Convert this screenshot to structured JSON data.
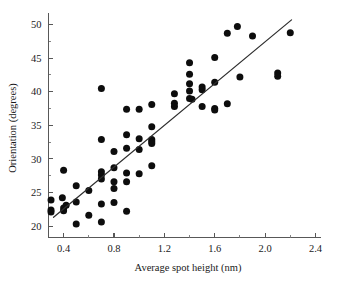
{
  "figure": {
    "background_color": "#ffffff",
    "point_color": "#0d0d0d",
    "line_color": "#2e2e2e",
    "axis_color": "#585858"
  },
  "chart_data": {
    "type": "scatter",
    "title": "",
    "xlabel": "Average spot height (nm)",
    "ylabel": "Orientation (degrees)",
    "xlim": [
      0.28,
      2.44
    ],
    "ylim": [
      18.3,
      51.8
    ],
    "xticks": [
      0.4,
      0.8,
      1.2,
      1.6,
      2.0,
      2.4
    ],
    "xtick_labels": [
      "0.4",
      "0.8",
      "1.2",
      "1.6",
      "2.0",
      "2.4"
    ],
    "xminor_ticks": [
      0.6,
      1.0,
      1.4,
      1.8,
      2.2
    ],
    "yticks": [
      20,
      25,
      30,
      35,
      40,
      45,
      50
    ],
    "ytick_labels": [
      "20",
      "25",
      "30",
      "35",
      "40",
      "45",
      "50"
    ],
    "grid": false,
    "legend": null,
    "marker": "filled-circle",
    "marker_size_px": 4.6,
    "points": [
      [
        0.3,
        23.9
      ],
      [
        0.3,
        22.4
      ],
      [
        0.3,
        22.1
      ],
      [
        0.39,
        24.2
      ],
      [
        0.4,
        28.3
      ],
      [
        0.4,
        22.7
      ],
      [
        0.4,
        22.3
      ],
      [
        0.42,
        23.1
      ],
      [
        0.5,
        26.0
      ],
      [
        0.5,
        23.6
      ],
      [
        0.5,
        20.3
      ],
      [
        0.6,
        25.3
      ],
      [
        0.6,
        21.6
      ],
      [
        0.7,
        40.5
      ],
      [
        0.7,
        32.9
      ],
      [
        0.7,
        28.1
      ],
      [
        0.7,
        27.6
      ],
      [
        0.7,
        27.0
      ],
      [
        0.7,
        23.3
      ],
      [
        0.7,
        20.6
      ],
      [
        0.8,
        31.1
      ],
      [
        0.8,
        28.7
      ],
      [
        0.8,
        26.6
      ],
      [
        0.8,
        25.6
      ],
      [
        0.8,
        23.5
      ],
      [
        0.9,
        37.4
      ],
      [
        0.9,
        33.6
      ],
      [
        0.9,
        31.6
      ],
      [
        0.9,
        27.9
      ],
      [
        0.9,
        26.6
      ],
      [
        0.9,
        22.2
      ],
      [
        1.0,
        37.4
      ],
      [
        1.0,
        33.0
      ],
      [
        1.0,
        31.4
      ],
      [
        1.0,
        27.8
      ],
      [
        1.1,
        38.1
      ],
      [
        1.1,
        34.8
      ],
      [
        1.1,
        32.9
      ],
      [
        1.1,
        32.6
      ],
      [
        1.1,
        32.3
      ],
      [
        1.1,
        29.0
      ],
      [
        1.28,
        39.7
      ],
      [
        1.28,
        38.3
      ],
      [
        1.28,
        37.8
      ],
      [
        1.4,
        44.3
      ],
      [
        1.4,
        42.6
      ],
      [
        1.4,
        41.2
      ],
      [
        1.4,
        40.1
      ],
      [
        1.4,
        39.0
      ],
      [
        1.42,
        38.9
      ],
      [
        1.5,
        40.7
      ],
      [
        1.5,
        40.3
      ],
      [
        1.5,
        37.8
      ],
      [
        1.6,
        45.1
      ],
      [
        1.6,
        41.4
      ],
      [
        1.6,
        37.5
      ],
      [
        1.6,
        37.3
      ],
      [
        1.7,
        48.7
      ],
      [
        1.7,
        38.2
      ],
      [
        1.78,
        49.7
      ],
      [
        1.8,
        42.2
      ],
      [
        1.9,
        48.3
      ],
      [
        2.1,
        42.8
      ],
      [
        2.1,
        42.3
      ],
      [
        2.2,
        48.8
      ]
    ],
    "trendline": {
      "type": "linear-fit",
      "x_start": 0.32,
      "y_start": 21.3,
      "x_end": 2.21,
      "y_end": 50.7
    }
  }
}
